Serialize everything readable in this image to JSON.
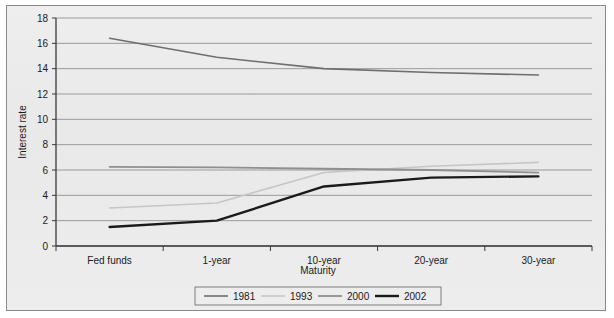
{
  "chart_data": {
    "type": "line",
    "title": "",
    "xlabel": "Maturity",
    "ylabel": "Interest rate",
    "categories": [
      "Fed funds",
      "1-year",
      "10-year",
      "20-year",
      "30-year"
    ],
    "ylim": [
      0,
      18
    ],
    "yticks": [
      0,
      2,
      4,
      6,
      8,
      10,
      12,
      14,
      16,
      18
    ],
    "ytick_labels": [
      "0",
      "2",
      "4",
      "6",
      "8",
      "10",
      "12",
      "14",
      "16",
      "18"
    ],
    "grid": true,
    "legend_position": "bottom",
    "series": [
      {
        "name": "1981",
        "color": "#6e6e6e",
        "width": 1.6,
        "values": [
          16.4,
          14.9,
          14.0,
          13.7,
          13.5
        ]
      },
      {
        "name": "1993",
        "color": "#c6c6c6",
        "width": 1.6,
        "values": [
          3.0,
          3.4,
          5.8,
          6.3,
          6.6
        ]
      },
      {
        "name": "2000",
        "color": "#8f8f8f",
        "width": 1.8,
        "values": [
          6.25,
          6.2,
          6.1,
          6.0,
          5.8
        ]
      },
      {
        "name": "2002",
        "color": "#1a1a1a",
        "width": 2.4,
        "values": [
          1.5,
          2.0,
          4.7,
          5.4,
          5.5
        ]
      }
    ]
  },
  "legend": {
    "entries": [
      {
        "label": "1981"
      },
      {
        "label": "1993"
      },
      {
        "label": "2000"
      },
      {
        "label": "2002"
      }
    ]
  },
  "colors": {
    "figure_background": "#ececec",
    "plot_background": "#ededed",
    "frame_border": "#8a8a8a",
    "axis": "#3a3a3a",
    "gridline": "#9b9b9b",
    "text": "#1a1a1a"
  }
}
